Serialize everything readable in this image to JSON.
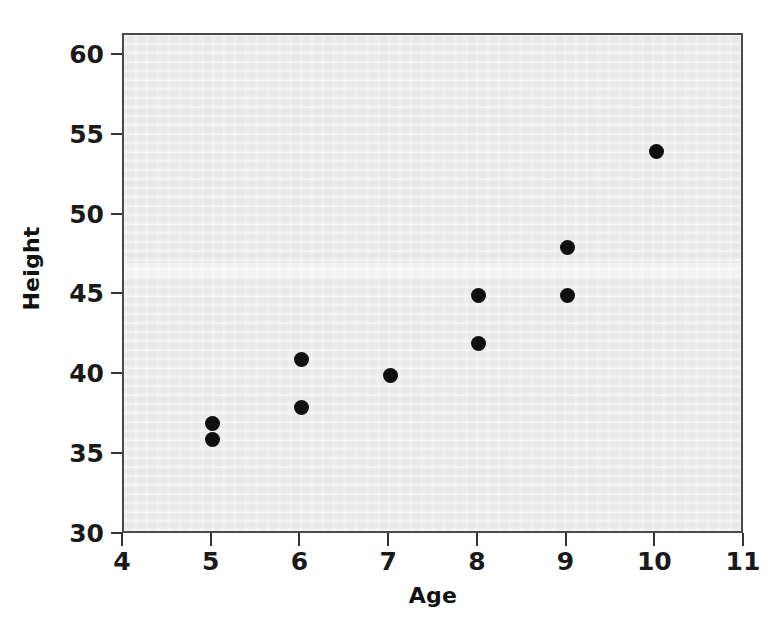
{
  "chart_data": {
    "type": "scatter",
    "title": "",
    "xlabel": "Age",
    "ylabel": "Height",
    "xlim": [
      4,
      11
    ],
    "ylim": [
      30,
      61.3
    ],
    "xticks": [
      4,
      5,
      6,
      7,
      8,
      9,
      10,
      11
    ],
    "xtick_labels": [
      "4",
      "5",
      "6",
      "7",
      "8",
      "9",
      "10",
      "11"
    ],
    "yticks": [
      30,
      35,
      40,
      45,
      50,
      55,
      60
    ],
    "ytick_labels": [
      "30",
      "35",
      "40",
      "45",
      "50",
      "55",
      "60"
    ],
    "grid": false,
    "legend": null,
    "marker_color": "#101010",
    "panel_color": "#ececec",
    "frame_color": "#4a4a4a",
    "x": [
      5,
      5,
      6,
      6,
      7,
      8,
      8,
      9,
      9,
      10
    ],
    "y": [
      37,
      36,
      41,
      38,
      40,
      45,
      42,
      48,
      45,
      54
    ],
    "points": [
      {
        "age": 5,
        "height": 37
      },
      {
        "age": 5,
        "height": 36
      },
      {
        "age": 6,
        "height": 41
      },
      {
        "age": 6,
        "height": 38
      },
      {
        "age": 7,
        "height": 40
      },
      {
        "age": 8,
        "height": 45
      },
      {
        "age": 8,
        "height": 42
      },
      {
        "age": 9,
        "height": 48
      },
      {
        "age": 9,
        "height": 45
      },
      {
        "age": 10,
        "height": 54
      }
    ]
  }
}
